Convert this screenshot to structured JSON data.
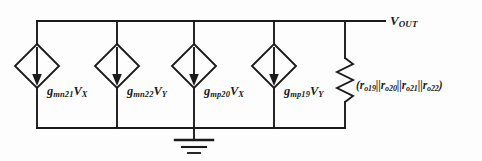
{
  "figure": {
    "kind": "small-signal-equivalent-circuit",
    "background_color": "#fdfdfd",
    "line_color": "#1b1b1b",
    "output_node": {
      "label_v": "V",
      "label_sub": "OUT",
      "full_text": "V_OUT"
    },
    "sources": [
      {
        "id": "source-1",
        "gm_base": "g",
        "gm_sub": "mn21",
        "control_var": "V",
        "control_sub": "X",
        "full_text": "g_mn21 V_X",
        "arrow_direction": "down",
        "x": 37
      },
      {
        "id": "source-2",
        "gm_base": "g",
        "gm_sub": "mn22",
        "control_var": "V",
        "control_sub": "Y",
        "full_text": "g_mn22 V_Y",
        "arrow_direction": "down",
        "x": 117
      },
      {
        "id": "source-3",
        "gm_base": "g",
        "gm_sub": "mp20",
        "control_var": "V",
        "control_sub": "X",
        "full_text": "g_mp20 V_X",
        "arrow_direction": "down",
        "x": 194
      },
      {
        "id": "source-4",
        "gm_base": "g",
        "gm_sub": "mp19",
        "control_var": "V",
        "control_sub": "Y",
        "full_text": "g_mp19 V_Y",
        "arrow_direction": "down",
        "x": 274
      }
    ],
    "resistor": {
      "id": "output-resistance",
      "open_paren": "(",
      "close_paren": ")",
      "separator": "||",
      "terms": [
        {
          "base": "r",
          "sub": "o19"
        },
        {
          "base": "r",
          "sub": "o20"
        },
        {
          "base": "r",
          "sub": "o21"
        },
        {
          "base": "r",
          "sub": "o22"
        }
      ],
      "full_text": "(r_o19||r_o20||r_o21||r_o22)",
      "x": 345
    },
    "ground": {
      "id": "ground-symbol",
      "bars": 3,
      "x": 194
    }
  }
}
